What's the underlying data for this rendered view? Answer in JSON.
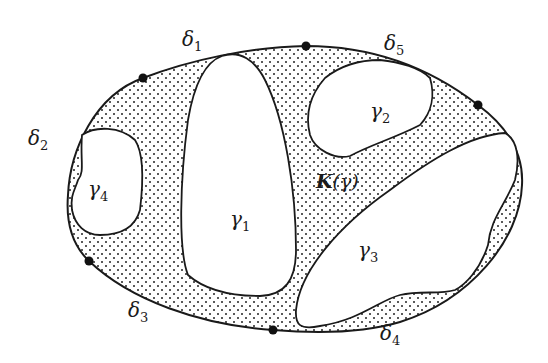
{
  "figure": {
    "region_label": {
      "main": "K",
      "paren_open": "(",
      "var": "γ",
      "paren_close": ")"
    },
    "boundary_arcs": [
      {
        "id": "delta1",
        "symbol": "δ",
        "index": "1"
      },
      {
        "id": "delta2",
        "symbol": "δ",
        "index": "2"
      },
      {
        "id": "delta3",
        "symbol": "δ",
        "index": "3"
      },
      {
        "id": "delta4",
        "symbol": "δ",
        "index": "4"
      },
      {
        "id": "delta5",
        "symbol": "δ",
        "index": "5"
      }
    ],
    "holes": [
      {
        "id": "gamma1",
        "symbol": "γ",
        "index": "1"
      },
      {
        "id": "gamma2",
        "symbol": "γ",
        "index": "2"
      },
      {
        "id": "gamma3",
        "symbol": "γ",
        "index": "3"
      },
      {
        "id": "gamma4",
        "symbol": "γ",
        "index": "4"
      }
    ],
    "boundary_points_count": 5,
    "colors": {
      "stroke": "#1a1a1a",
      "fill_dots": "#222222",
      "background": "#ffffff"
    }
  }
}
